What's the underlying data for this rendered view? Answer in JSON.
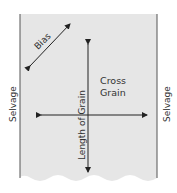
{
  "diagram": {
    "labels": {
      "bias": "Bias",
      "cross_grain_line1": "Cross",
      "cross_grain_line2": "Grain",
      "length_of_grain": "Length of Grain",
      "selvage_left": "Selvage",
      "selvage_right": "Selvage"
    },
    "colors": {
      "fabric": "#e6e6e6",
      "edge": "#555555",
      "arrow": "#222222",
      "text": "#333333"
    }
  }
}
